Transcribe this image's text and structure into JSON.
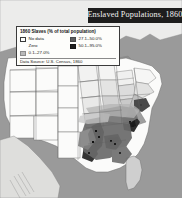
{
  "figure": {
    "title_banner": "Enslaved Populations, 1860"
  },
  "legend": {
    "title": "1860 Slaves (% of total population)",
    "items": [
      {
        "label": "No data",
        "swatch": "no-data-swatch",
        "color": "#ffffff"
      },
      {
        "label": "27.1–50.0%",
        "swatch": "mid-class-swatch",
        "color": "#5d5d5d"
      },
      {
        "label": "Zero",
        "swatch": "zero-swatch",
        "color": "#ffffff"
      },
      {
        "label": "50.1–95.0%",
        "swatch": "high-class-swatch",
        "color": "#1f1f1f"
      },
      {
        "label": "0.1–27.0%",
        "swatch": "low-class-swatch",
        "color": "#b9b9b9"
      }
    ],
    "source": "Data Source: U.S. Census, 1860"
  },
  "map": {
    "region": "United States, eastern and central",
    "projection_note": "county-level choropleth",
    "colors": {
      "ocean": "#9a9a9a",
      "land_outside": "#e8e8e6",
      "state_fill_zero": "#fbfbfa",
      "class_low": "#bdbdbd",
      "class_mid": "#646464",
      "class_high": "#232323",
      "border": "#6d6d6d"
    }
  }
}
